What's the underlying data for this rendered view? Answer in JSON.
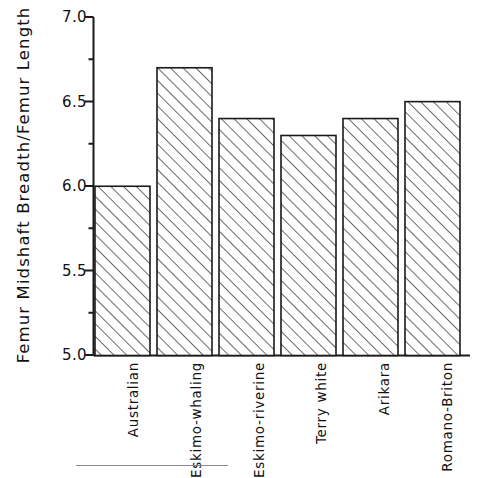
{
  "chart_data": {
    "type": "bar",
    "title": "",
    "xlabel": "",
    "ylabel": "Femur Midshaft Breadth/Femur Length",
    "categories": [
      "Australian",
      "Eskimo-whaling",
      "Eskimo-riverine",
      "Terry white",
      "Arikara",
      "Romano-Briton"
    ],
    "values": [
      6.0,
      6.7,
      6.4,
      6.3,
      6.4,
      6.5
    ],
    "ylim": [
      5.0,
      7.0
    ],
    "ytick_labels": [
      "7.0",
      "6.5",
      "6.0",
      "5.5",
      "5.0"
    ],
    "ytick_values": [
      7.0,
      6.5,
      6.0,
      5.5,
      5.0
    ],
    "yminor_ticks": [
      6.75,
      6.25,
      5.75,
      5.25
    ],
    "grid": false,
    "legend": null,
    "bar_fill": "diagonal-hatch",
    "bar_edge_color": "#1a1a1a",
    "axis_color": "#1a1a1a",
    "background_color": "#ffffff"
  },
  "figure": {
    "footer_rule": true
  }
}
